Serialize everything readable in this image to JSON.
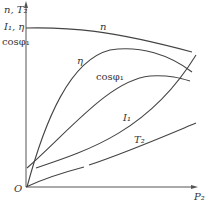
{
  "diagram": {
    "title": "",
    "axes": {
      "y_labels": [
        "n, T₂",
        "I₁, η",
        "cosφ₁"
      ],
      "x_label": "P₂",
      "origin_label": "O"
    },
    "curves": [
      {
        "name": "n",
        "label": "n"
      },
      {
        "name": "eta",
        "label": "η"
      },
      {
        "name": "cosphi1",
        "label": "cosφ₁"
      },
      {
        "name": "I1",
        "label": "I₁"
      },
      {
        "name": "T2",
        "label": "T₂"
      }
    ]
  },
  "colors": {
    "line": "#444444",
    "axis": "#555555",
    "background": "#ffffff"
  }
}
